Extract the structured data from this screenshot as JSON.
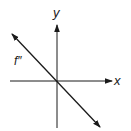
{
  "diagram": {
    "title": "",
    "axes": {
      "x_label": "x",
      "y_label": "y"
    },
    "curves": [
      {
        "label": "f″",
        "type": "line",
        "slope": "negative",
        "through_origin": true,
        "arrows": "both-ends"
      }
    ],
    "colors": {
      "stroke": "#1a1a1a",
      "background": "#ffffff"
    }
  }
}
